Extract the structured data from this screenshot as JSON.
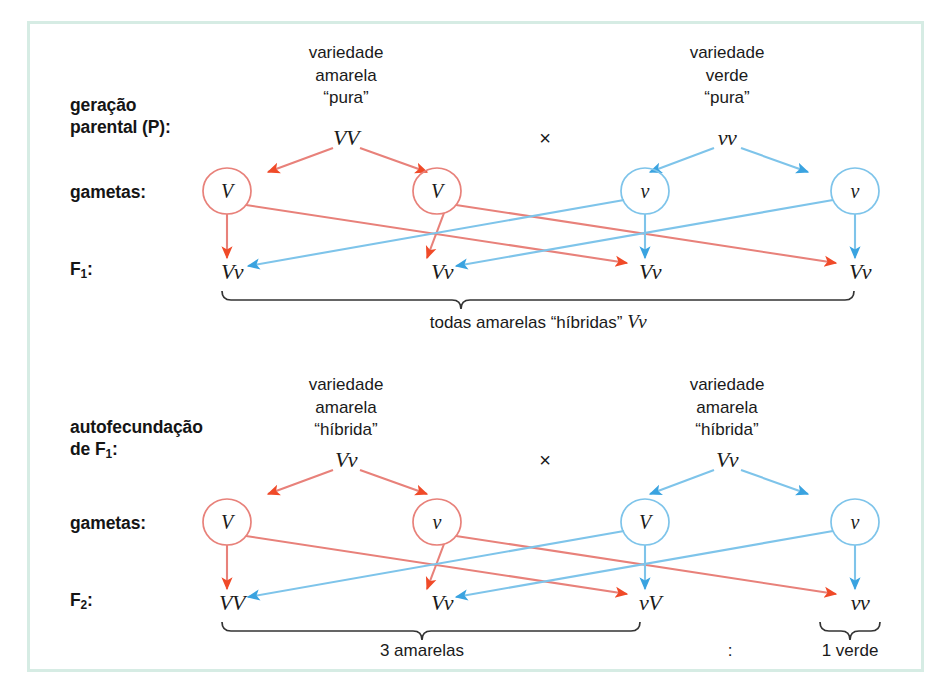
{
  "figure": {
    "frame_color": "#d6ece4",
    "red_line_color": "#e8817a",
    "red_head_color": "#f04a28",
    "blue_line_color": "#7ec4ea",
    "blue_head_color": "#3aa3e0",
    "background": "#ffffff"
  },
  "row_labels": {
    "parental_line1": "geração",
    "parental_line2": "parental (P):",
    "gametes_top": "gametas:",
    "f1": "F",
    "f1_sub": "1",
    "f1_colon": ":",
    "self_line1": "autofecundação",
    "self_line2_pre": "de F",
    "self_line2_sub": "1",
    "self_line2_post": ":",
    "gametes_bottom": "gametas:",
    "f2": "F",
    "f2_sub": "2",
    "f2_colon": ":"
  },
  "top_cross": {
    "left_parent": {
      "line1": "variedade",
      "line2": "amarela",
      "line3": "“pura”",
      "genotype": "VV"
    },
    "cross_symbol": "×",
    "right_parent": {
      "line1": "variedade",
      "line2": "verde",
      "line3": "“pura”",
      "genotype": "vv"
    },
    "gametes": [
      "V",
      "V",
      "v",
      "v"
    ],
    "offspring": [
      "Vv",
      "Vv",
      "Vv",
      "Vv"
    ],
    "summary_prefix": "todas amarelas “híbridas” ",
    "summary_genotype": "Vv"
  },
  "bottom_cross": {
    "left_parent": {
      "line1": "variedade",
      "line2": "amarela",
      "line3": "“híbrida”",
      "genotype": "Vv"
    },
    "cross_symbol": "×",
    "right_parent": {
      "line1": "variedade",
      "line2": "amarela",
      "line3": "“híbrida”",
      "genotype": "Vv"
    },
    "gametes": [
      "V",
      "v",
      "V",
      "v"
    ],
    "offspring": [
      "VV",
      "Vv",
      "vV",
      "vv"
    ],
    "summary_left": "3 amarelas",
    "ratio_separator": ":",
    "summary_right": "1 verde"
  }
}
